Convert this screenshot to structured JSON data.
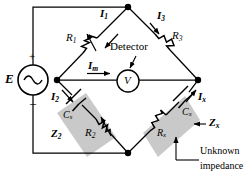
{
  "figure": {
    "type": "circuit-diagram",
    "background": "#ffffff",
    "line_color": "#000000",
    "shade_color": "#c9c9c9"
  },
  "source": {
    "label": "E",
    "plus": "+",
    "minus": "–",
    "symbol": "ac-sine"
  },
  "detector": {
    "caption": "Detector",
    "meter_label": "V"
  },
  "components": {
    "r1": {
      "label": "R",
      "sub": "1",
      "kind": "variable-resistor"
    },
    "r3": {
      "label": "R",
      "sub": "3",
      "kind": "resistor"
    },
    "r2": {
      "label": "R",
      "sub": "2",
      "kind": "variable-resistor"
    },
    "rx": {
      "label": "R",
      "sub": "x",
      "kind": "resistor"
    },
    "cs": {
      "label": "C",
      "sub": "s",
      "kind": "capacitor"
    },
    "cx": {
      "label": "C",
      "sub": "x",
      "kind": "capacitor"
    }
  },
  "currents": {
    "i1": {
      "label": "I",
      "sub": "1"
    },
    "i3": {
      "label": "I",
      "sub": "3"
    },
    "i2": {
      "label": "I",
      "sub": "2"
    },
    "ix": {
      "label": "I",
      "sub": "x"
    },
    "im": {
      "label": "I",
      "sub": "m"
    }
  },
  "impedances": {
    "z2": {
      "label": "Z",
      "sub": "2"
    },
    "zx": {
      "label": "Z",
      "sub": "x"
    }
  },
  "annotations": {
    "unknown_line1": "Unknown",
    "unknown_line2": "impedance"
  }
}
